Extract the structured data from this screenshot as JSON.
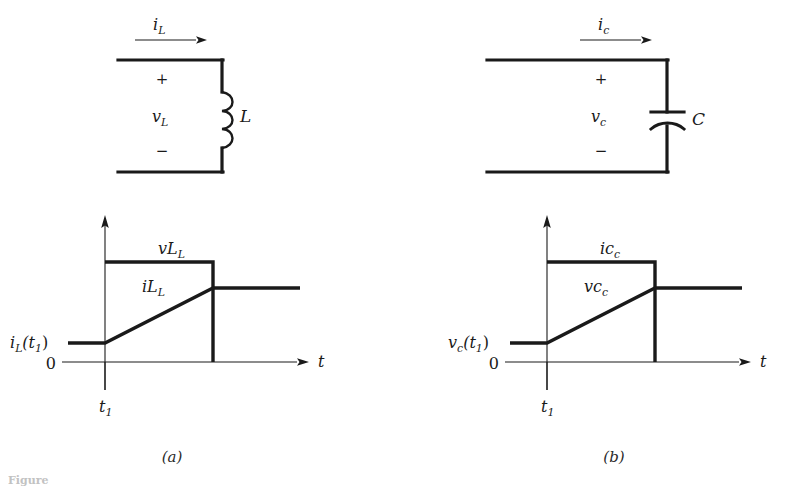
{
  "figure": {
    "title_fragment": "Figure",
    "caption_clipped": "Figure",
    "background_color": "#ffffff",
    "ink_color": "#1a1a1a",
    "panels": [
      {
        "id": "a",
        "label": "(a)",
        "element": "inductor"
      },
      {
        "id": "b",
        "label": "(b)",
        "element": "capacitor"
      }
    ]
  },
  "panel_a": {
    "circuit": {
      "current_label": "i",
      "current_subscript": "L",
      "voltage_label": "v",
      "voltage_subscript": "L",
      "plus_sign": "+",
      "minus_sign": "−",
      "component_label": "L",
      "component_type": "inductor"
    },
    "graph": {
      "y_zero_label": "0",
      "x_axis_label": "t",
      "time_tick_label": "t",
      "time_tick_subscript": "1",
      "initial_value_label": "i",
      "initial_value_sub": "L",
      "initial_value_arg": "(t",
      "initial_value_arg_sub": "1",
      "initial_value_arg_close": ")",
      "curve_labels": [
        {
          "name": "v",
          "subscript": "L",
          "description": "constant voltage pulse"
        },
        {
          "name": "i",
          "subscript": "L",
          "description": "linearly ramping current"
        }
      ]
    }
  },
  "panel_b": {
    "circuit": {
      "current_label": "i",
      "current_subscript": "c",
      "voltage_label": "v",
      "voltage_subscript": "c",
      "plus_sign": "+",
      "minus_sign": "−",
      "component_label": "C",
      "component_type": "capacitor"
    },
    "graph": {
      "y_zero_label": "0",
      "x_axis_label": "t",
      "time_tick_label": "t",
      "time_tick_subscript": "1",
      "initial_value_label": "v",
      "initial_value_sub": "c",
      "initial_value_arg": "(t",
      "initial_value_arg_sub": "1",
      "initial_value_arg_close": ")",
      "curve_labels": [
        {
          "name": "i",
          "subscript": "c",
          "description": "constant current pulse"
        },
        {
          "name": "v",
          "subscript": "c",
          "description": "linearly ramping voltage"
        }
      ]
    }
  },
  "chart_data": [
    {
      "type": "line",
      "title": "Inductor waveforms (a)",
      "xlabel": "t",
      "ylabel": "",
      "axis_origin_label": "0",
      "ticks": {
        "x": [
          "t1"
        ]
      },
      "series": [
        {
          "name": "vL",
          "label": "v_L",
          "description": "rectangular pulse: zero before t1, constant positive from t1 to t2, zero after t2",
          "points": [
            [
              0.0,
              0.0
            ],
            [
              0.32,
              0.0
            ],
            [
              0.32,
              1.0
            ],
            [
              0.68,
              1.0
            ],
            [
              0.68,
              0.0
            ],
            [
              1.0,
              0.0
            ]
          ]
        },
        {
          "name": "iL",
          "label": "i_L",
          "description": "constant iL(t1) before t1, linear ramp from t1 to t2, constant after t2",
          "points": [
            [
              0.0,
              0.18
            ],
            [
              0.32,
              0.18
            ],
            [
              0.68,
              0.7
            ],
            [
              1.0,
              0.7
            ]
          ]
        }
      ]
    },
    {
      "type": "line",
      "title": "Capacitor waveforms (b)",
      "xlabel": "t",
      "ylabel": "",
      "axis_origin_label": "0",
      "ticks": {
        "x": [
          "t1"
        ]
      },
      "series": [
        {
          "name": "ic",
          "label": "i_c",
          "description": "rectangular pulse: zero before t1, constant positive from t1 to t2, zero after t2",
          "points": [
            [
              0.0,
              0.0
            ],
            [
              0.32,
              0.0
            ],
            [
              0.32,
              1.0
            ],
            [
              0.68,
              1.0
            ],
            [
              0.68,
              0.0
            ],
            [
              1.0,
              0.0
            ]
          ]
        },
        {
          "name": "vc",
          "label": "v_c",
          "description": "constant vc(t1) before t1, linear ramp from t1 to t2, constant after t2",
          "points": [
            [
              0.0,
              0.18
            ],
            [
              0.32,
              0.18
            ],
            [
              0.68,
              0.7
            ],
            [
              1.0,
              0.7
            ]
          ]
        }
      ]
    }
  ]
}
